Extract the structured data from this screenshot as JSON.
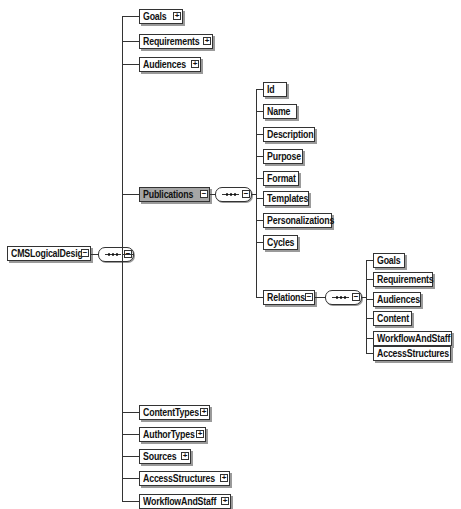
{
  "diagram": {
    "root": {
      "label": "CMSLogicalDesign",
      "expander": "−",
      "compositor": "sequence",
      "compositor_expander": "−"
    },
    "root_children": [
      {
        "label": "Goals",
        "expander": "+"
      },
      {
        "label": "Requirements",
        "expander": "+"
      },
      {
        "label": "Audiences",
        "expander": "+"
      },
      {
        "label": "Publications",
        "expander": "−",
        "selected": true
      },
      {
        "label": "ContentTypes",
        "expander": "+"
      },
      {
        "label": "AuthorTypes",
        "expander": "+"
      },
      {
        "label": "Sources",
        "expander": "+"
      },
      {
        "label": "AccessStructures",
        "expander": "+"
      },
      {
        "label": "WorkflowAndStaff",
        "expander": "+"
      }
    ],
    "publications": {
      "compositor": "sequence",
      "compositor_expander": "−",
      "children": [
        {
          "label": "Id"
        },
        {
          "label": "Name"
        },
        {
          "label": "Description"
        },
        {
          "label": "Purpose"
        },
        {
          "label": "Format"
        },
        {
          "label": "Templates"
        },
        {
          "label": "Personalizations"
        },
        {
          "label": "Cycles"
        },
        {
          "label": "Relations",
          "expander": "−"
        }
      ]
    },
    "relations": {
      "compositor": "sequence",
      "compositor_expander": "−",
      "children": [
        {
          "label": "Goals"
        },
        {
          "label": "Requirements"
        },
        {
          "label": "Audiences"
        },
        {
          "label": "Content"
        },
        {
          "label": "WorkflowAndStaff"
        },
        {
          "label": "AccessStructures"
        }
      ]
    },
    "colors": {
      "selected_fill": "#a6a6a6",
      "line": "#333333",
      "shadow": "#9a9a9a",
      "background": "#ffffff"
    }
  }
}
